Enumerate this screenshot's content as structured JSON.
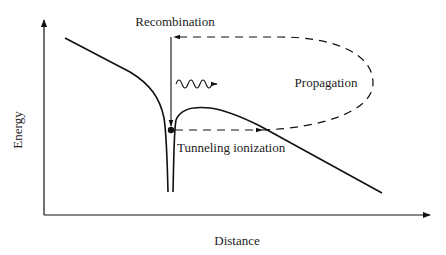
{
  "diagram": {
    "type": "three-step model of strong-field ionization",
    "labels": {
      "recombination": "Recombination",
      "propagation": "Propagation",
      "tunneling": "Tunneling ionization",
      "y_axis": "Energy",
      "x_axis": "Distance"
    },
    "colors": {
      "line": "#111111",
      "text": "#222222",
      "background": "#ffffff"
    }
  }
}
